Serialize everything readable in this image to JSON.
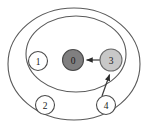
{
  "diagram": {
    "type": "nested-ellipse-node-diagram",
    "background_color": "#ffffff",
    "stroke_color": "#5a5a5a",
    "regions": [
      {
        "id": "outer-ellipse",
        "name": "outer region",
        "cx": 74,
        "cy": 64,
        "rx": 66,
        "ry": 56,
        "fill": "none",
        "stroke": "#5a5a5a"
      },
      {
        "id": "inner-ellipse",
        "name": "inner region",
        "cx": 76,
        "cy": 54,
        "rx": 50,
        "ry": 38,
        "fill": "none",
        "stroke": "#5a5a5a"
      }
    ],
    "nodes": [
      {
        "id": "node-0",
        "label": "0",
        "cx": 73,
        "cy": 60,
        "r": 10.5,
        "fill": "#807f80",
        "stroke": "#4a4a4a",
        "style": "dark-filled",
        "label_color": "#1a1a1a"
      },
      {
        "id": "node-1",
        "label": "1",
        "cx": 38,
        "cy": 61,
        "r": 9.5,
        "fill": "#ffffff",
        "stroke": "#4a4a4a",
        "style": "open",
        "label_color": "#1a1a1a"
      },
      {
        "id": "node-2",
        "label": "2",
        "cx": 45,
        "cy": 105,
        "r": 9.5,
        "fill": "#ffffff",
        "stroke": "#4a4a4a",
        "style": "open",
        "label_color": "#1a1a1a"
      },
      {
        "id": "node-3",
        "label": "3",
        "cx": 111,
        "cy": 60,
        "r": 11,
        "fill": "#c8c8c8",
        "stroke": "#6a6a6a",
        "style": "light-filled",
        "label_color": "#1a1a1a"
      },
      {
        "id": "node-4",
        "label": "4",
        "cx": 106,
        "cy": 105,
        "r": 9.5,
        "fill": "#ffffff",
        "stroke": "#4a4a4a",
        "style": "open",
        "label_color": "#1a1a1a"
      }
    ],
    "edges": [
      {
        "id": "edge-3-to-0",
        "from": "node-3",
        "to": "node-0",
        "x1": 100,
        "y1": 60,
        "x2": 85,
        "y2": 60,
        "arrow": "end",
        "stroke": "#3a3a3a"
      },
      {
        "id": "edge-4-to-3",
        "from": "node-4",
        "to": "node-3",
        "x1": 102,
        "y1": 96,
        "x2": 110,
        "y2": 73,
        "arrow": "end",
        "stroke": "#3a3a3a"
      }
    ]
  }
}
